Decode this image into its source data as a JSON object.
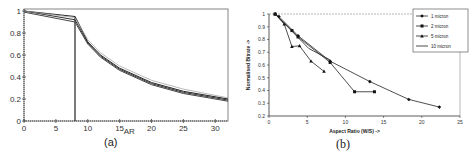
{
  "chart_data": [
    {
      "id": "a",
      "type": "line",
      "title": "",
      "caption": "(a)",
      "xlabel": "AR",
      "ylabel": "",
      "xlim": [
        0,
        32
      ],
      "ylim": [
        0,
        1.05
      ],
      "x_ticks": [
        "0",
        "5",
        "10",
        "15",
        "20",
        "25",
        "30"
      ],
      "y_ticks": [
        "0",
        "0.2",
        "0.4",
        "0.6",
        "0.8",
        "1"
      ],
      "grid": false,
      "legend": null,
      "annotations": [
        "vertical line at AR = 8"
      ],
      "vertical_line_x": 8,
      "series": [
        {
          "name": "curve 1",
          "x": [
            0,
            8,
            8.2,
            10,
            12,
            15,
            20,
            25,
            32
          ],
          "values": [
            1.0,
            0.95,
            0.93,
            0.72,
            0.6,
            0.48,
            0.35,
            0.27,
            0.2
          ]
        },
        {
          "name": "curve 2",
          "x": [
            0,
            8,
            8.2,
            10,
            12,
            15,
            20,
            25,
            32
          ],
          "values": [
            1.0,
            0.92,
            0.9,
            0.71,
            0.59,
            0.47,
            0.34,
            0.26,
            0.19
          ]
        },
        {
          "name": "curve 3",
          "x": [
            0,
            8,
            8.2,
            10,
            12,
            15,
            20,
            25,
            32
          ],
          "values": [
            0.99,
            0.9,
            0.88,
            0.7,
            0.58,
            0.46,
            0.33,
            0.25,
            0.18
          ]
        },
        {
          "name": "curve 4",
          "x": [
            0,
            8,
            8.2,
            10,
            12,
            15,
            20,
            25,
            32
          ],
          "values": [
            1.0,
            0.94,
            0.92,
            0.74,
            0.62,
            0.5,
            0.37,
            0.29,
            0.21
          ]
        }
      ]
    },
    {
      "id": "b",
      "type": "line",
      "title": "",
      "caption": "(b)",
      "xlabel": "Aspect Ratio (W/S) ->",
      "ylabel": "Normalised Bitrate ->",
      "xlim": [
        0,
        25
      ],
      "ylim": [
        0.2,
        1.0
      ],
      "x_ticks": [
        "0",
        "5",
        "10",
        "15",
        "20",
        "25"
      ],
      "y_ticks": [
        "0.2",
        "0.3",
        "0.4",
        "0.5",
        "0.6",
        "0.7",
        "0.8",
        "0.9",
        "1"
      ],
      "grid": false,
      "legend_position": "upper right",
      "series": [
        {
          "name": "1 micron",
          "marker": "diamond",
          "x": [
            0.8,
            1.3,
            3.8,
            8,
            13.2,
            18.3,
            22.3
          ],
          "values": [
            1.0,
            0.98,
            0.83,
            0.63,
            0.47,
            0.33,
            0.27
          ]
        },
        {
          "name": "2 micron",
          "marker": "square",
          "x": [
            0.8,
            3,
            3.8,
            8,
            11.2,
            13.8
          ],
          "values": [
            1.0,
            0.87,
            0.82,
            0.62,
            0.39,
            0.39
          ]
        },
        {
          "name": "5 micron",
          "marker": "triangle",
          "x": [
            0.8,
            2,
            3,
            4,
            5.5,
            7.2
          ],
          "values": [
            1.0,
            0.92,
            0.745,
            0.75,
            0.63,
            0.55
          ]
        },
        {
          "name": "10 micron",
          "marker": "none",
          "x": [
            0.8,
            5.2,
            8
          ],
          "values": [
            1.0,
            0.73,
            0.64
          ]
        }
      ]
    }
  ],
  "panel_a": {
    "caption": "(a)",
    "xlabel": "AR",
    "x_ticks": [
      "0",
      "5",
      "10",
      "15",
      "20",
      "25",
      "30"
    ],
    "y_ticks": [
      "0",
      "0.2",
      "0.4",
      "0.6",
      "0.8",
      "1"
    ]
  },
  "panel_b": {
    "caption": "(b)",
    "xlabel": "Aspect Ratio (W/S) ->",
    "ylabel": "Normalised Bitrate ->",
    "x_ticks": [
      "0",
      "5",
      "10",
      "15",
      "20",
      "25"
    ],
    "y_ticks": [
      "0.2",
      "0.3",
      "0.4",
      "0.5",
      "0.6",
      "0.7",
      "0.8",
      "0.9",
      "1"
    ],
    "legend": [
      "1 micron",
      "2 micron",
      "5 micron",
      "10 micron"
    ]
  }
}
